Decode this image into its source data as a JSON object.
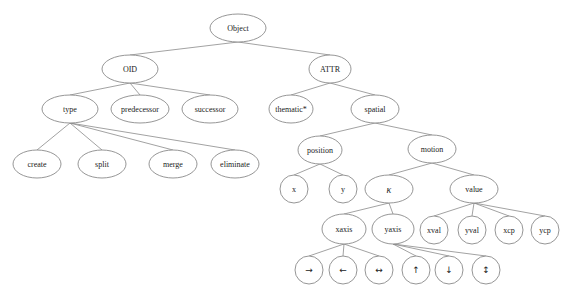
{
  "diagram": {
    "type": "tree",
    "nodes": [
      {
        "id": "object",
        "label": "Object",
        "x": 238,
        "y": 28,
        "rx": 28,
        "ry": 14
      },
      {
        "id": "oid",
        "label": "OID",
        "x": 130,
        "y": 69,
        "rx": 28,
        "ry": 14,
        "parent": "object"
      },
      {
        "id": "attr",
        "label": "ATTR",
        "x": 330,
        "y": 69,
        "rx": 21,
        "ry": 14,
        "parent": "object"
      },
      {
        "id": "type",
        "label": "type",
        "x": 70,
        "y": 109,
        "rx": 28,
        "ry": 14,
        "parent": "oid"
      },
      {
        "id": "predecessor",
        "label": "predecessor",
        "x": 140,
        "y": 109,
        "rx": 29,
        "ry": 14,
        "parent": "oid"
      },
      {
        "id": "successor",
        "label": "successor",
        "x": 210,
        "y": 109,
        "rx": 28,
        "ry": 14,
        "parent": "oid"
      },
      {
        "id": "thematic",
        "label": "thematic*",
        "x": 291,
        "y": 109,
        "rx": 22,
        "ry": 14,
        "parent": "attr"
      },
      {
        "id": "spatial",
        "label": "spatial",
        "x": 375,
        "y": 109,
        "rx": 24,
        "ry": 14,
        "parent": "attr"
      },
      {
        "id": "create",
        "label": "create",
        "x": 37,
        "y": 164,
        "rx": 24,
        "ry": 14,
        "parent": "type"
      },
      {
        "id": "split",
        "label": "split",
        "x": 102,
        "y": 164,
        "rx": 24,
        "ry": 14,
        "parent": "type"
      },
      {
        "id": "merge",
        "label": "merge",
        "x": 173,
        "y": 164,
        "rx": 24,
        "ry": 14,
        "parent": "type"
      },
      {
        "id": "eliminate",
        "label": "eliminate",
        "x": 235,
        "y": 164,
        "rx": 24,
        "ry": 14,
        "parent": "type"
      },
      {
        "id": "position",
        "label": "position",
        "x": 320,
        "y": 150,
        "rx": 22,
        "ry": 14,
        "parent": "spatial"
      },
      {
        "id": "motion",
        "label": "motion",
        "x": 432,
        "y": 149,
        "rx": 24,
        "ry": 14,
        "parent": "spatial"
      },
      {
        "id": "x",
        "label": "x",
        "x": 294,
        "y": 189,
        "rx": 14,
        "ry": 14,
        "parent": "position"
      },
      {
        "id": "y",
        "label": "y",
        "x": 343,
        "y": 189,
        "rx": 14,
        "ry": 14,
        "parent": "position"
      },
      {
        "id": "kappa",
        "label": "κ",
        "x": 389,
        "y": 189,
        "rx": 24,
        "ry": 14,
        "parent": "motion",
        "style": "italic"
      },
      {
        "id": "value",
        "label": "value",
        "x": 474,
        "y": 189,
        "rx": 24,
        "ry": 14,
        "parent": "motion"
      },
      {
        "id": "xaxis",
        "label": "xaxis",
        "x": 344,
        "y": 229,
        "rx": 22,
        "ry": 15,
        "parent": "kappa"
      },
      {
        "id": "yaxis",
        "label": "yaxis",
        "x": 393,
        "y": 229,
        "rx": 21,
        "ry": 15,
        "parent": "kappa"
      },
      {
        "id": "xval",
        "label": "xval",
        "x": 434,
        "y": 230,
        "rx": 14,
        "ry": 14,
        "parent": "value"
      },
      {
        "id": "yval",
        "label": "yval",
        "x": 472,
        "y": 230,
        "rx": 14,
        "ry": 14,
        "parent": "value"
      },
      {
        "id": "xcp",
        "label": "xcp",
        "x": 509,
        "y": 230,
        "rx": 14,
        "ry": 14,
        "parent": "value"
      },
      {
        "id": "ycp",
        "label": "ycp",
        "x": 545,
        "y": 230,
        "rx": 14,
        "ry": 14,
        "parent": "value"
      },
      {
        "id": "right-arrow",
        "label": "→",
        "x": 309,
        "y": 270,
        "rx": 14,
        "ry": 14,
        "parent": "xaxis",
        "style": "arrow"
      },
      {
        "id": "left-arrow",
        "label": "←",
        "x": 343,
        "y": 270,
        "rx": 14,
        "ry": 14,
        "parent": "xaxis",
        "style": "arrow"
      },
      {
        "id": "left-right-arrow",
        "label": "↔",
        "x": 379,
        "y": 270,
        "rx": 14,
        "ry": 14,
        "parent": "xaxis",
        "style": "arrow"
      },
      {
        "id": "up-arrow",
        "label": "↑",
        "x": 416,
        "y": 270,
        "rx": 14,
        "ry": 14,
        "parent": "yaxis",
        "style": "arrow"
      },
      {
        "id": "down-arrow",
        "label": "↓",
        "x": 449,
        "y": 270,
        "rx": 14,
        "ry": 14,
        "parent": "yaxis",
        "style": "arrow"
      },
      {
        "id": "up-down-arrow",
        "label": "↕",
        "x": 486,
        "y": 270,
        "rx": 14,
        "ry": 14,
        "parent": "yaxis",
        "style": "arrow"
      }
    ],
    "colors": {
      "edge": "#8a8a8a",
      "node_stroke": "#8a8a8a",
      "node_fill": "#ffffff",
      "text": "#222222"
    }
  }
}
